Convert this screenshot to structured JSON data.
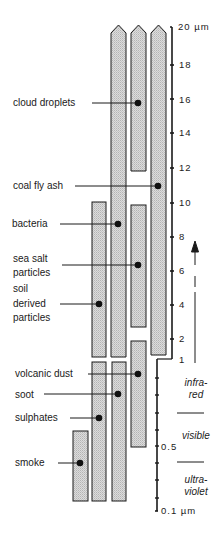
{
  "diagram": {
    "axis": {
      "upper_scale": {
        "unit": "µm",
        "type": "linear",
        "ticks": [
          {
            "label": "20 µm",
            "value": 20
          },
          {
            "label": "18",
            "value": 18
          },
          {
            "label": "16",
            "value": 16
          },
          {
            "label": "14",
            "value": 14
          },
          {
            "label": "12",
            "value": 12
          },
          {
            "label": "10",
            "value": 10
          },
          {
            "label": "8",
            "value": 8
          },
          {
            "label": "6",
            "value": 6
          },
          {
            "label": "4",
            "value": 4
          },
          {
            "label": "2",
            "value": 2
          },
          {
            "label": "1",
            "value": 1
          }
        ]
      },
      "lower_scale": {
        "unit": "µm",
        "type": "log",
        "ticks": [
          {
            "label": "0.5",
            "value": 0.5
          },
          {
            "label": "0.1 µm",
            "value": 0.1
          }
        ]
      }
    },
    "bands": [
      {
        "label_line1": "infra-",
        "label_line2": "red"
      },
      {
        "label_line1": "visible",
        "label_line2": ""
      },
      {
        "label_line1": "ultra-",
        "label_line2": "violet"
      }
    ],
    "particles": [
      {
        "label": "cloud droplets",
        "range": "~12–20+ µm"
      },
      {
        "label": "coal fly ash",
        "range": "~1–20+ µm"
      },
      {
        "label": "bacteria",
        "range": "~1–20+ µm"
      },
      {
        "label": "sea salt particles",
        "range": "~2–10 µm"
      },
      {
        "label": "soil derived particles",
        "range": "~1–10 µm"
      },
      {
        "label": "volcanic dust",
        "range": "~0.5–2 µm"
      },
      {
        "label": "soot",
        "range": "~0.1–1 µm"
      },
      {
        "label": "sulphates",
        "range": "~0.1–1 µm"
      },
      {
        "label": "smoke",
        "range": "~0.1–0.4 µm"
      }
    ],
    "labels": {
      "cloud_droplets": "cloud droplets",
      "coal_fly_ash": "coal fly ash",
      "bacteria": "bacteria",
      "sea_salt_1": "sea salt",
      "sea_salt_2": "particles",
      "soil_1": "soil",
      "soil_2": "derived",
      "soil_3": "particles",
      "volcanic_dust": "volcanic dust",
      "soot": "soot",
      "sulphates": "sulphates",
      "smoke": "smoke"
    },
    "colors": {
      "bar_fill": "#d4d4d4",
      "stroke": "#1a1a1a",
      "background": "#ffffff"
    }
  }
}
